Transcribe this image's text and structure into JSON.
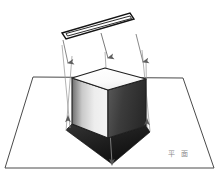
{
  "figure": {
    "background_color": "#ffffff",
    "width": 218,
    "height": 175
  },
  "light_source": {
    "name": "linear-light-bar",
    "shape": "thin elongated parallelogram outline",
    "stroke_color": "#1a1a1a",
    "fill_color": "#ffffff",
    "outline_points": "62,33 130,13 134,19 66,39",
    "inner_points": "66,33.5 130,16 131.5,18.5 67.5,36"
  },
  "ground_plane": {
    "name": "ground-plane-trapezoid",
    "shape": "trapezoid (perspective horizontal plane)",
    "stroke_color": "#4a4a4a",
    "fill_color": "none",
    "points": "33,77 183,78 214,168 5,168"
  },
  "cube": {
    "name": "cube",
    "top_face": {
      "label": "top-face",
      "points": "72,78 105,68 146,79 108,90",
      "fill": "#fbfbfb",
      "stroke": "#1f1f1f"
    },
    "left_face": {
      "label": "left-face",
      "points": "72,78 108,90 108,138 72,124",
      "fill_gradient_from": "#6e6e6e",
      "fill_gradient_to": "#f2f2f2",
      "stroke": "#1f1f1f"
    },
    "right_face": {
      "label": "right-face",
      "points": "108,90 146,79 146,126 108,138",
      "fill_gradient_from": "#4a4a4a",
      "fill_gradient_to": "#2b2b2b",
      "stroke": "#1f1f1f"
    }
  },
  "shadow": {
    "name": "cast-shadow",
    "shape": "dark quadrilateral on ground plane",
    "fill_gradient_from": "#2e2e2e",
    "fill_gradient_to": "#0f0f0f",
    "points": "72,124 108,138 146,126 150,132 112,164 66,130",
    "stroke": "#111111"
  },
  "light_rays": [
    {
      "name": "light-ray-left",
      "from_x": 63,
      "from_y": 40,
      "to_x": 68,
      "to_y": 63,
      "color": "#7a7a7a",
      "arrow": "down"
    },
    {
      "name": "light-ray-center",
      "from_x": 101,
      "from_y": 33,
      "to_x": 108,
      "to_y": 58,
      "color": "#6a6a6a",
      "arrow": "down"
    },
    {
      "name": "light-ray-right",
      "from_x": 136,
      "from_y": 34,
      "to_x": 143,
      "to_y": 62,
      "color": "#7a7a7a",
      "arrow": "down"
    }
  ],
  "projection_lines": [
    {
      "name": "projection-line-left-outer",
      "from_x": 62,
      "from_y": 45,
      "to_x": 70,
      "to_y": 128,
      "color": "#9a9a9a"
    },
    {
      "name": "projection-line-left-inner",
      "from_x": 72,
      "from_y": 56,
      "to_x": 66,
      "to_y": 131,
      "color": "#9a9a9a"
    },
    {
      "name": "projection-line-center",
      "from_x": 105,
      "from_y": 52,
      "to_x": 112,
      "to_y": 163,
      "color": "#9a9a9a"
    },
    {
      "name": "projection-line-right-outer",
      "from_x": 142,
      "from_y": 50,
      "to_x": 150,
      "to_y": 131,
      "color": "#9a9a9a"
    },
    {
      "name": "projection-line-right-inner",
      "from_x": 146,
      "from_y": 60,
      "to_x": 147,
      "to_y": 127,
      "color": "#9a9a9a"
    }
  ],
  "base_arrows": [
    {
      "name": "base-arrow-left",
      "x": 68,
      "y": 121,
      "direction": "up",
      "color": "#5a5a5a"
    },
    {
      "name": "base-arrow-right",
      "x": 147,
      "y": 124,
      "direction": "up",
      "color": "#5a5a5a"
    },
    {
      "name": "base-arrow-center",
      "x": 112,
      "y": 160,
      "direction": "down",
      "color": "#5a5a5a"
    }
  ],
  "caption": {
    "name": "figure-caption",
    "text": "平 面",
    "color": "#8a8a8a",
    "x": 168,
    "y": 148
  }
}
